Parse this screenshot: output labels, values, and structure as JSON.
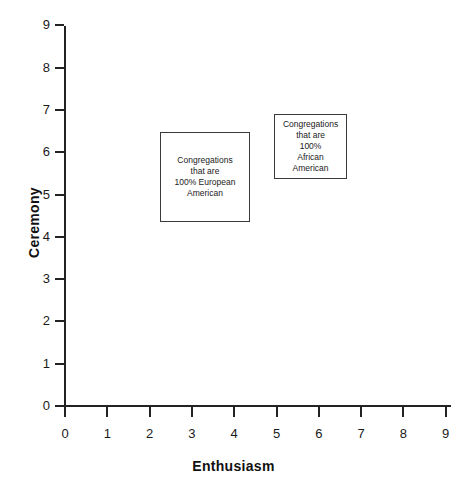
{
  "chart_data": {
    "type": "scatter",
    "title": "",
    "xlabel": "Enthusiasm",
    "ylabel": "Ceremony",
    "xlim": [
      0,
      9
    ],
    "ylim": [
      0,
      9
    ],
    "xticks": [
      "0",
      "1",
      "2",
      "3",
      "4",
      "5",
      "6",
      "7",
      "8",
      "9"
    ],
    "yticks": [
      "0",
      "1",
      "2",
      "3",
      "4",
      "5",
      "6",
      "7",
      "8",
      "9"
    ],
    "grid": false,
    "legend": null,
    "series": [],
    "annotations": [
      {
        "id": "european-american",
        "label": "Congregations\nthat are\n100% European\nAmerican",
        "lines": [
          "Congregations",
          "that are",
          "100% European",
          "American"
        ],
        "x_range": [
          2.25,
          4.37
        ],
        "y_range": [
          4.36,
          6.48
        ]
      },
      {
        "id": "african-american",
        "label": "Congregations\nthat are\n100%\nAfrican\nAmerican",
        "lines": [
          "Congregations",
          "that are",
          "100%",
          "African",
          "American"
        ],
        "x_range": [
          4.94,
          6.67
        ],
        "y_range": [
          5.37,
          6.91
        ]
      }
    ]
  },
  "colors": {
    "axis": "#222222",
    "text": "#1a1a1a",
    "box_border": "#3a3a3a",
    "background": "#ffffff"
  }
}
